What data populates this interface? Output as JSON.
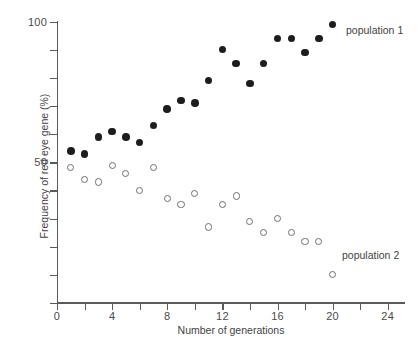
{
  "chart_data": {
    "type": "scatter",
    "title": "",
    "xlabel": "Number of generations",
    "ylabel": "Frequency of red eye gene (%)",
    "xlim": [
      0,
      25.3
    ],
    "ylim": [
      0,
      100
    ],
    "xticks": [
      0,
      2,
      4,
      6,
      8,
      10,
      12,
      14,
      16,
      18,
      20,
      22,
      24
    ],
    "xtick_labels": [
      "0",
      "",
      "4",
      "",
      "8",
      "",
      "12",
      "",
      "16",
      "",
      "20",
      "",
      "24"
    ],
    "yticks": [
      0,
      10,
      20,
      30,
      40,
      50,
      60,
      70,
      80,
      90,
      100
    ],
    "ytick_labels": [
      "",
      "",
      "",
      "",
      "",
      "50",
      "",
      "",
      "",
      "",
      "100"
    ],
    "grid": false,
    "legend_position": "inline-right",
    "series": [
      {
        "name": "population 1",
        "marker": "filled-circle",
        "color": "#1d1d1d",
        "points": [
          {
            "x": 1,
            "y": 54
          },
          {
            "x": 2,
            "y": 53
          },
          {
            "x": 3,
            "y": 59
          },
          {
            "x": 4,
            "y": 61
          },
          {
            "x": 5,
            "y": 59
          },
          {
            "x": 6,
            "y": 57
          },
          {
            "x": 7,
            "y": 63
          },
          {
            "x": 8,
            "y": 69
          },
          {
            "x": 9,
            "y": 72
          },
          {
            "x": 10,
            "y": 71
          },
          {
            "x": 11,
            "y": 79
          },
          {
            "x": 12,
            "y": 90
          },
          {
            "x": 13,
            "y": 85
          },
          {
            "x": 14,
            "y": 78
          },
          {
            "x": 15,
            "y": 85
          },
          {
            "x": 16,
            "y": 94
          },
          {
            "x": 17,
            "y": 94
          },
          {
            "x": 18,
            "y": 89
          },
          {
            "x": 19,
            "y": 94
          },
          {
            "x": 20,
            "y": 99
          }
        ]
      },
      {
        "name": "population 2",
        "marker": "open-circle",
        "color": "#6e6e6e",
        "points": [
          {
            "x": 1,
            "y": 48
          },
          {
            "x": 2,
            "y": 44
          },
          {
            "x": 3,
            "y": 43
          },
          {
            "x": 4,
            "y": 49
          },
          {
            "x": 5,
            "y": 46
          },
          {
            "x": 6,
            "y": 40
          },
          {
            "x": 7,
            "y": 48
          },
          {
            "x": 8,
            "y": 37
          },
          {
            "x": 9,
            "y": 35
          },
          {
            "x": 10,
            "y": 39
          },
          {
            "x": 11,
            "y": 27
          },
          {
            "x": 12,
            "y": 35
          },
          {
            "x": 13,
            "y": 38
          },
          {
            "x": 14,
            "y": 29
          },
          {
            "x": 15,
            "y": 25
          },
          {
            "x": 16,
            "y": 30
          },
          {
            "x": 17,
            "y": 25
          },
          {
            "x": 18,
            "y": 22
          },
          {
            "x": 19,
            "y": 22
          },
          {
            "x": 20,
            "y": 10
          }
        ]
      }
    ],
    "annotations": [
      {
        "text": "population 1",
        "x": 21.0,
        "y": 93
      },
      {
        "text": "population 2",
        "x": 20.7,
        "y": 19
      }
    ]
  }
}
